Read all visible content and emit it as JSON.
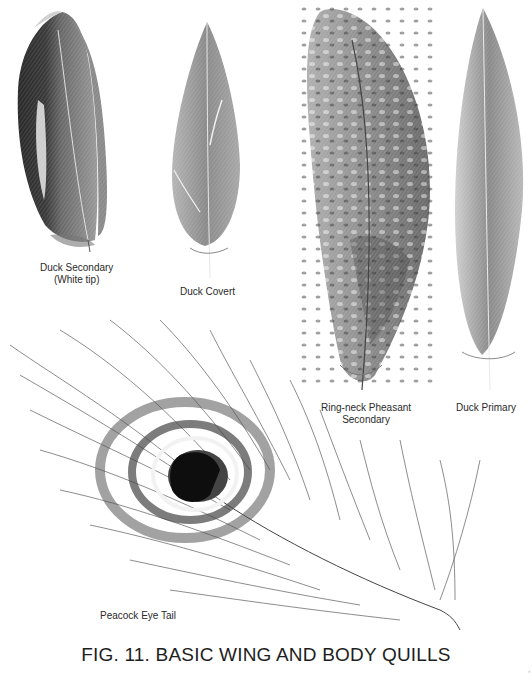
{
  "figure": {
    "caption": "FIG. 11. BASIC WING AND BODY QUILLS",
    "page_mark": "ʼ"
  },
  "feathers": [
    {
      "id": "duck-secondary",
      "label_line1": "Duck Secondary",
      "label_line2": "(White tip)"
    },
    {
      "id": "duck-covert",
      "label_line1": "Duck Covert"
    },
    {
      "id": "ring-neck-pheasant-secondary",
      "label_line1": "Ring-neck Pheasant",
      "label_line2": "Secondary"
    },
    {
      "id": "duck-primary",
      "label_line1": "Duck Primary"
    },
    {
      "id": "peacock-eye-tail",
      "label_line1": "Peacock Eye Tail"
    }
  ],
  "colors": {
    "background": "#ffffff",
    "ink": "#222222",
    "dark_ink": "#111111"
  }
}
